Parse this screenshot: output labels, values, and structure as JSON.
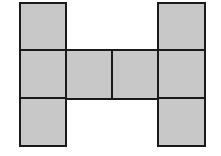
{
  "diagram": {
    "type": "net-of-squares",
    "fill_color": "#c8c8c8",
    "stroke_color": "#1a1a1a",
    "grid": {
      "cols": 4,
      "rows": 3
    },
    "cells": [
      {
        "col": 0,
        "row": 0
      },
      {
        "col": 0,
        "row": 1
      },
      {
        "col": 0,
        "row": 2
      },
      {
        "col": 1,
        "row": 1
      },
      {
        "col": 2,
        "row": 1
      },
      {
        "col": 3,
        "row": 0
      },
      {
        "col": 3,
        "row": 1
      },
      {
        "col": 3,
        "row": 2
      }
    ]
  }
}
